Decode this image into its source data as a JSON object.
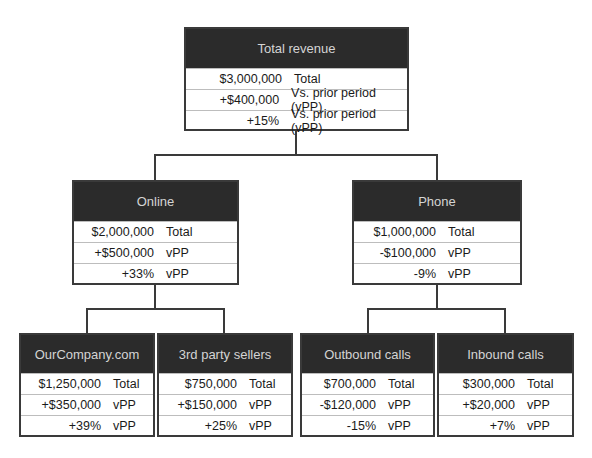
{
  "diagram": {
    "type": "tree",
    "root": {
      "title": "Total revenue",
      "rows": [
        {
          "value": "$3,000,000",
          "label": "Total"
        },
        {
          "value": "+$400,000",
          "label": "Vs. prior period (vPP)"
        },
        {
          "value": "+15%",
          "label": "Vs. prior period (vPP)"
        }
      ]
    },
    "level2": [
      {
        "title": "Online",
        "rows": [
          {
            "value": "$2,000,000",
            "label": "Total"
          },
          {
            "value": "+$500,000",
            "label": "vPP"
          },
          {
            "value": "+33%",
            "label": "vPP"
          }
        ]
      },
      {
        "title": "Phone",
        "rows": [
          {
            "value": "$1,000,000",
            "label": "Total"
          },
          {
            "value": "-$100,000",
            "label": "vPP"
          },
          {
            "value": "-9%",
            "label": "vPP"
          }
        ]
      }
    ],
    "level3": [
      {
        "title": "OurCompany.com",
        "rows": [
          {
            "value": "$1,250,000",
            "label": "Total"
          },
          {
            "value": "+$350,000",
            "label": "vPP"
          },
          {
            "value": "+39%",
            "label": "vPP"
          }
        ]
      },
      {
        "title": "3rd party sellers",
        "rows": [
          {
            "value": "$750,000",
            "label": "Total"
          },
          {
            "value": "+$150,000",
            "label": "vPP"
          },
          {
            "value": "+25%",
            "label": "vPP"
          }
        ]
      },
      {
        "title": "Outbound calls",
        "rows": [
          {
            "value": "$700,000",
            "label": "Total"
          },
          {
            "value": "-$120,000",
            "label": "vPP"
          },
          {
            "value": "-15%",
            "label": "vPP"
          }
        ]
      },
      {
        "title": "Inbound calls",
        "rows": [
          {
            "value": "$300,000",
            "label": "Total"
          },
          {
            "value": "+$20,000",
            "label": "vPP"
          },
          {
            "value": "+7%",
            "label": "vPP"
          }
        ]
      }
    ],
    "colors": {
      "header_bg": "#2b2b2b",
      "header_text": "#d4d4d4",
      "border": "#3a3a3a",
      "row_separator": "#bdbdbd"
    }
  }
}
